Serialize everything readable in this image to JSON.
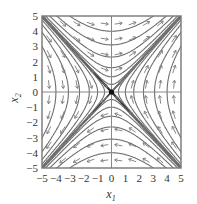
{
  "figure": {
    "type": "phase_portrait",
    "xlabel": "x",
    "xlabel_sub": "1",
    "ylabel": "x",
    "ylabel_sub": "2",
    "xlim": [
      -5,
      5
    ],
    "ylim": [
      -5,
      5
    ],
    "xticks": [
      "−5",
      "−4",
      "−3",
      "−2",
      "−1",
      "0",
      "1",
      "2",
      "3",
      "4",
      "5"
    ],
    "yticks": [
      "5",
      "4",
      "3",
      "2",
      "1",
      "0",
      "−1",
      "−2",
      "−3",
      "−4",
      "−5"
    ],
    "equilibrium": {
      "x1": 0,
      "x2": 0,
      "kind": "saddle"
    },
    "manifolds": {
      "stable": "x2 = -x1",
      "unstable": "x2 = x1"
    },
    "colors": {
      "curve": "#6e6e6e",
      "manifold": "#3a3a3a",
      "arrow": "#7a7a7a",
      "axis": "#888888",
      "frame": "#777777",
      "text": "#333333"
    }
  }
}
